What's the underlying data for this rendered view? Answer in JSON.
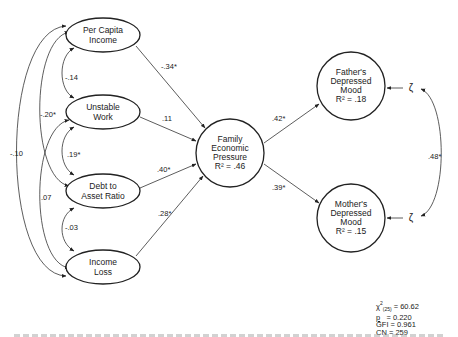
{
  "nodes": {
    "per_capita_income": {
      "line1": "Per Capita",
      "line2": "Income"
    },
    "unstable_work": {
      "line1": "Unstable",
      "line2": "Work"
    },
    "debt_to_asset": {
      "line1": "Debt to",
      "line2": "Asset Ratio"
    },
    "income_loss": {
      "line1": "Income",
      "line2": "Loss"
    },
    "family_economic_pressure": {
      "line1": "Family",
      "line2": "Economic",
      "line3": "Pressure",
      "r2": "R² = .46"
    },
    "fathers_mood": {
      "line1": "Father's",
      "line2": "Depressed",
      "line3": "Mood",
      "r2": "R² = .18"
    },
    "mothers_mood": {
      "line1": "Mother's",
      "line2": "Depressed",
      "line3": "Mood",
      "r2": "R² = .15"
    }
  },
  "disturbance_symbol": "ζ",
  "paths": {
    "pci_to_fep": "-.34*",
    "uw_to_fep": ".11",
    "da_to_fep": ".40*",
    "il_to_fep": ".28*",
    "fep_to_father": ".42*",
    "fep_to_mother": ".39*"
  },
  "correlations": {
    "pci_uw": "-.14",
    "pci_da": "-.20*",
    "pci_il": "-.10",
    "uw_da": ".19*",
    "uw_il": ".07",
    "da_il": "-.03",
    "father_mother_resid": ".48*"
  },
  "fit": {
    "chi_symbol": "χ",
    "chi_sup": "2",
    "chi_sub": "(25)",
    "chi_value": "= 60.62",
    "p_label": "p",
    "p_value": "= 0.220",
    "gfi": "GFI = 0.961",
    "cn": "CN  = 259"
  }
}
